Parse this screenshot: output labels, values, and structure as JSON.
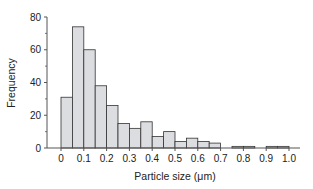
{
  "chart_data": {
    "type": "bar",
    "subtype": "histogram",
    "title": "",
    "xlabel": "Particle size (μm)",
    "ylabel": "Frequency",
    "xlim": [
      0,
      1.0
    ],
    "ylim": [
      0,
      80
    ],
    "bin_width": 0.05,
    "bin_edges": [
      0,
      0.05,
      0.1,
      0.15,
      0.2,
      0.25,
      0.3,
      0.35,
      0.4,
      0.45,
      0.5,
      0.55,
      0.6,
      0.65,
      0.7,
      0.75,
      0.8,
      0.85,
      0.9,
      0.95,
      1.0
    ],
    "values": [
      31,
      74,
      60,
      38,
      26,
      15,
      12,
      16,
      7,
      10,
      4,
      6,
      4,
      3,
      0,
      1,
      1,
      0,
      1,
      1
    ],
    "x_ticks": [
      "0",
      "0.1",
      "0.2",
      "0.3",
      "0.4",
      "0.5",
      "0.6",
      "0.7",
      "0.8",
      "0.9",
      "1.0"
    ],
    "x_tick_values": [
      0,
      0.1,
      0.2,
      0.3,
      0.4,
      0.5,
      0.6,
      0.7,
      0.8,
      0.9,
      1.0
    ],
    "y_ticks": [
      "0",
      "20",
      "40",
      "60",
      "80"
    ],
    "y_tick_values": [
      0,
      20,
      40,
      60,
      80
    ],
    "y_minor_ticks": [
      10,
      30,
      50,
      70
    ],
    "grid": false,
    "legend": null,
    "colors": {
      "bar_fill": "#dcdde0",
      "bar_stroke": "#333333",
      "axis": "#555555"
    }
  }
}
